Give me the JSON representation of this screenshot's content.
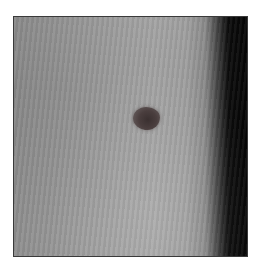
{
  "image": {
    "subject": "skin surface with single pigmented lesion (mole)",
    "frame": {
      "left": 13,
      "top": 16,
      "width": 235,
      "height": 241,
      "border_color": "#3a3a3a"
    },
    "colors": {
      "skin_gray": "#a0a0a0",
      "shadow_edge": "#050505",
      "lesion": "#3a3030",
      "background": "#ffffff"
    },
    "lesion": {
      "center_x": 145,
      "center_y": 118,
      "approx_diameter_px": 26
    }
  }
}
